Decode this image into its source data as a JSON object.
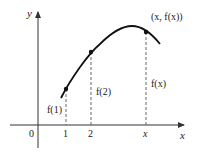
{
  "figure": {
    "axes": {
      "x_label": "x",
      "y_label": "y",
      "origin_label": "0"
    },
    "ticks": [
      {
        "label": "1",
        "x": 66
      },
      {
        "label": "2",
        "x": 91
      },
      {
        "label": "x",
        "x": 146
      }
    ],
    "points": [
      {
        "label": "f(1)",
        "x": 66,
        "y": 89
      },
      {
        "label": "f(2)",
        "x": 91,
        "y": 52
      },
      {
        "label": "f(x)",
        "x": 146,
        "y": 32
      }
    ],
    "point_annotation": "(x, f(x))",
    "colors": {
      "curve": "#111111",
      "axis": "#333333",
      "dashed": "#555555",
      "text": "#222222"
    }
  }
}
